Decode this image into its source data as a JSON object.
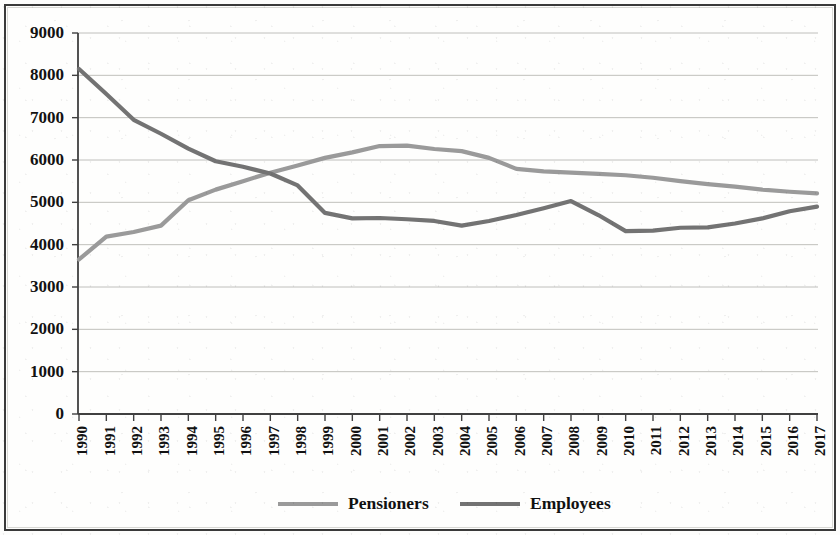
{
  "chart_data": {
    "type": "line",
    "title": "",
    "subtitle": "",
    "xlabel": "",
    "ylabel": "",
    "grid": "horizontal",
    "legend_position": "bottom",
    "ylim": [
      0,
      9000
    ],
    "ytick_step": 1000,
    "ytick_labels": [
      "9000",
      "8000",
      "7000",
      "6000",
      "5000",
      "4000",
      "3000",
      "2000",
      "1000",
      "0"
    ],
    "categories": [
      "1990",
      "1991",
      "1992",
      "1993",
      "1994",
      "1995",
      "1996",
      "1997",
      "1998",
      "1999",
      "2000",
      "2001",
      "2002",
      "2003",
      "2004",
      "2005",
      "2006",
      "2007",
      "2008",
      "2009",
      "2010",
      "2011",
      "2012",
      "2013",
      "2014",
      "2015",
      "2016",
      "2017"
    ],
    "series": [
      {
        "name": "Pensioners",
        "color": "#9a9a9a",
        "values": [
          3650,
          4190,
          4300,
          4450,
          5050,
          5300,
          5500,
          5700,
          5870,
          6050,
          6180,
          6330,
          6340,
          6260,
          6210,
          6050,
          5790,
          5730,
          5700,
          5670,
          5640,
          5580,
          5500,
          5430,
          5370,
          5300,
          5250,
          5210
        ]
      },
      {
        "name": "Employees",
        "color": "#737373",
        "values": [
          8150,
          7560,
          6950,
          6620,
          6270,
          5970,
          5840,
          5680,
          5400,
          4750,
          4620,
          4630,
          4600,
          4560,
          4450,
          4560,
          4700,
          4860,
          5030,
          4700,
          4320,
          4330,
          4400,
          4410,
          4500,
          4620,
          4790,
          4900
        ]
      }
    ]
  },
  "legend": {
    "items": [
      {
        "label": "Pensioners",
        "color": "#9a9a9a"
      },
      {
        "label": "Employees",
        "color": "#737373"
      }
    ]
  },
  "axes": {
    "y_max_label": "9000",
    "y_min_label": "0",
    "x_first_label": "1990",
    "x_last_label": "2017"
  }
}
